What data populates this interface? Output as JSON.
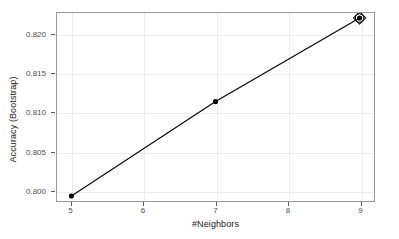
{
  "chart_data": {
    "type": "line",
    "title": "",
    "xlabel": "#Neighbors",
    "ylabel": "Accuracy (Bootstrap)",
    "x": [
      5,
      7,
      9
    ],
    "values": [
      0.7992,
      0.8114,
      0.8222
    ],
    "series": [
      {
        "name": "Accuracy (Bootstrap)",
        "x": [
          5,
          7,
          9
        ],
        "values": [
          0.7992,
          0.8114,
          0.8222
        ]
      }
    ],
    "xlim": [
      4.8,
      9.2
    ],
    "ylim": [
      0.79855,
      0.82285
    ],
    "xticks": [
      5,
      6,
      7,
      8,
      9
    ],
    "xticklabels": [
      "5",
      "6",
      "7",
      "8",
      "9"
    ],
    "yticks": [
      0.8,
      0.805,
      0.81,
      0.815,
      0.82
    ],
    "yticklabels": [
      "0.800",
      "0.805",
      "0.810",
      "0.815",
      "0.820"
    ],
    "grid": true,
    "legend": false,
    "marker": "filled-circle",
    "highlight": {
      "x": 9,
      "y": 0.8222,
      "marker": "open-diamond",
      "note": "selected tuning parameter"
    },
    "colors": {
      "line": "#000000",
      "marker": "#000000",
      "panel_border": "#9a9a9a",
      "gridline": "#ededed",
      "tick_label": "#4d4d4d",
      "axis_title": "#1a1a1a",
      "background": "#ffffff"
    }
  }
}
